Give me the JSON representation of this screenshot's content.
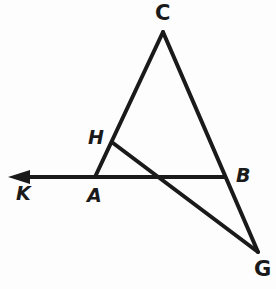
{
  "figure": {
    "kind": "geometry-diagram",
    "background_color": "#fdfdfd",
    "stroke_color": "#1a1a1a",
    "width": 276,
    "height": 289,
    "points": {
      "C": {
        "x": 163,
        "y": 32
      },
      "H": {
        "x": 113,
        "y": 143
      },
      "A": {
        "x": 95,
        "y": 177
      },
      "B": {
        "x": 227,
        "y": 177
      },
      "G": {
        "x": 258,
        "y": 252
      },
      "K": {
        "x": 8,
        "y": 177
      },
      "X": {
        "x": 163,
        "y": 177
      }
    },
    "segments": [
      {
        "name": "segment-C-A",
        "from": "C",
        "to": "A",
        "width": 4
      },
      {
        "name": "segment-C-G",
        "from": "C",
        "to": "G",
        "width": 4
      },
      {
        "name": "segment-H-G",
        "from": "H",
        "to": "G",
        "width": 4
      },
      {
        "name": "ray-K-B",
        "from": "K",
        "to": "B",
        "width": 4
      }
    ],
    "arrow": {
      "name": "arrowhead-K",
      "direction": "left",
      "tip_x": 8,
      "tip_y": 177,
      "length": 22,
      "half_height": 7
    },
    "labels": {
      "C": "C",
      "H": "H",
      "K": "K",
      "A": "A",
      "B": "B",
      "G": "G"
    }
  }
}
